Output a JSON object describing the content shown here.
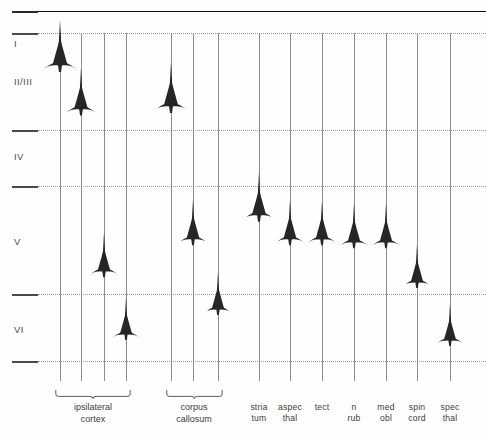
{
  "figure": {
    "background_color": "#fefefe",
    "ink_color": "#2a2a2a",
    "axis_color": "#8c8c8c",
    "laminar_line_color": "#9a9a9a"
  },
  "laminae": [
    {
      "id": "I",
      "label": "I",
      "top_y": 11,
      "bottom_y": 33,
      "label_y": 44
    },
    {
      "id": "II_III",
      "label": "II/III",
      "top_y": 33,
      "bottom_y": 130,
      "label_y": 82
    },
    {
      "id": "IV",
      "label": "IV",
      "top_y": 130,
      "bottom_y": 186,
      "label_y": 157
    },
    {
      "id": "V",
      "label": "V",
      "top_y": 186,
      "bottom_y": 294,
      "label_y": 242
    },
    {
      "id": "VI",
      "label": "VI",
      "top_y": 294,
      "bottom_y": 361,
      "label_y": 330
    }
  ],
  "laminar_borders": [
    {
      "y": 11,
      "style": "solid"
    },
    {
      "y": 33,
      "style": "dotted"
    },
    {
      "y": 130,
      "style": "dotted"
    },
    {
      "y": 186,
      "style": "dotted"
    },
    {
      "y": 294,
      "style": "dotted"
    },
    {
      "y": 361,
      "style": "dotted"
    }
  ],
  "columns": [
    {
      "id": "ipsi-1",
      "label": "",
      "x": 60,
      "soma_y": 66,
      "scale": 1.0,
      "group": "ipsilateral-cortex"
    },
    {
      "id": "ipsi-2",
      "label": "",
      "x": 81,
      "soma_y": 110,
      "scale": 0.92,
      "group": "ipsilateral-cortex"
    },
    {
      "id": "ipsi-3",
      "label": "",
      "x": 104,
      "soma_y": 272,
      "scale": 0.86,
      "group": "ipsilateral-cortex"
    },
    {
      "id": "ipsi-4",
      "label": "",
      "x": 126,
      "soma_y": 335,
      "scale": 0.82,
      "group": "ipsilateral-cortex"
    },
    {
      "id": "cc-1",
      "label": "",
      "x": 171,
      "soma_y": 107,
      "scale": 0.98,
      "group": "corpus-callosum"
    },
    {
      "id": "cc-2",
      "label": "",
      "x": 193,
      "soma_y": 240,
      "scale": 0.88,
      "group": "corpus-callosum"
    },
    {
      "id": "cc-3",
      "label": "",
      "x": 218,
      "soma_y": 310,
      "scale": 0.84,
      "group": "corpus-callosum"
    },
    {
      "id": "striatum",
      "label": "stria\ntum",
      "x": 259,
      "soma_y": 216,
      "scale": 0.95,
      "group": null
    },
    {
      "id": "aspec-thal",
      "label": "aspec\nthal",
      "x": 290,
      "soma_y": 240,
      "scale": 0.88,
      "group": null
    },
    {
      "id": "tectum",
      "label": "tect",
      "x": 322,
      "soma_y": 240,
      "scale": 0.86,
      "group": null
    },
    {
      "id": "n-ruber",
      "label": "n\nrub",
      "x": 354,
      "soma_y": 243,
      "scale": 0.86,
      "group": null
    },
    {
      "id": "med-obl",
      "label": "med\nobl",
      "x": 386,
      "soma_y": 243,
      "scale": 0.86,
      "group": null
    },
    {
      "id": "spinal-cord",
      "label": "spin\ncord",
      "x": 417,
      "soma_y": 283,
      "scale": 0.84,
      "group": null
    },
    {
      "id": "spec-thal",
      "label": "spec\nthal",
      "x": 450,
      "soma_y": 341,
      "scale": 0.82,
      "group": null
    }
  ],
  "groups": [
    {
      "id": "ipsilateral-cortex",
      "label": "ipsilateral\ncortex",
      "x_start": 60,
      "x_end": 126,
      "center_x": 93,
      "brace_y": 390,
      "label_y": 402
    },
    {
      "id": "corpus-callosum",
      "label": "corpus\ncallosum",
      "x_start": 171,
      "x_end": 218,
      "center_x": 194,
      "brace_y": 390,
      "label_y": 402
    }
  ],
  "chart_data": {
    "type": "scatter",
    "xlabel": "",
    "ylabel": "cortical lamina",
    "grid": true,
    "legend": "none",
    "y_categories": [
      "I",
      "II/III",
      "IV",
      "V",
      "VI"
    ],
    "categories": [
      "ipsilateral cortex 1",
      "ipsilateral cortex 2",
      "ipsilateral cortex 3",
      "ipsilateral cortex 4",
      "corpus callosum 1",
      "corpus callosum 2",
      "corpus callosum 3",
      "striatum",
      "aspec thal",
      "tect",
      "n rub",
      "med obl",
      "spin cord",
      "spec thal"
    ],
    "series": [
      {
        "name": "soma laminar position",
        "values": [
          "II/III (upper)",
          "II/III (lower)",
          "V (lower)",
          "VI",
          "II/III (lower)",
          "V (upper)",
          "VI (upper)",
          "V (upper)",
          "V",
          "V",
          "V",
          "V",
          "V (lower)",
          "VI"
        ]
      }
    ]
  }
}
